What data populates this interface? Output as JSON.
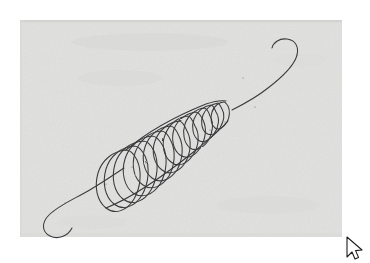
{
  "document": {
    "kind": "scanned-paper-drawing",
    "canvas_width": 370,
    "canvas_height": 263,
    "page_background_color": "#ffffff",
    "scan_area": {
      "x": 20,
      "y": 20,
      "width": 322,
      "height": 217,
      "fill_color": "#e1e1e0",
      "edge_shadow_color": "#cfcfce",
      "texture": "paper-grain"
    }
  },
  "artwork": {
    "name": "conical-helix-spring-sketch",
    "medium": "ink-pen-line-drawing",
    "stroke_color": "#3a3a3c",
    "stroke_width": 1.05,
    "description": "Hand drawn conical helix coil running diagonally from lower left to upper right, wide loops at the lower left tapering to a tight small loop at the upper right, with straight tails at both ends that hook back on themselves",
    "axis": {
      "start_x": 118,
      "start_y": 171,
      "end_x": 236,
      "end_y": 107
    },
    "coil": {
      "turn_count": 13,
      "wide_end_radius_x": 30,
      "wide_end_radius_y": 46,
      "narrow_end_radius_x": 12,
      "narrow_end_radius_y": 19,
      "tilt_degrees": -28
    },
    "tails": [
      {
        "name": "lower-left-tail",
        "from_x": 114,
        "from_y": 175,
        "hook_tip_x": 70,
        "hook_tip_y": 224
      },
      {
        "name": "upper-right-tail",
        "from_x": 240,
        "from_y": 104,
        "hook_tip_x": 287,
        "hook_tip_y": 43
      }
    ],
    "speck_marks": [
      {
        "x": 243,
        "y": 78
      },
      {
        "x": 255,
        "y": 107
      },
      {
        "x": 225,
        "y": 122
      },
      {
        "x": 132,
        "y": 167
      },
      {
        "x": 106,
        "y": 184
      },
      {
        "x": 65,
        "y": 203
      },
      {
        "x": 210,
        "y": 130
      }
    ]
  },
  "cursor": {
    "name": "arrow-pointer",
    "tip_x": 347,
    "tip_y": 237,
    "fill_color": "#ffffff",
    "outline_color": "#1d1d1f"
  }
}
